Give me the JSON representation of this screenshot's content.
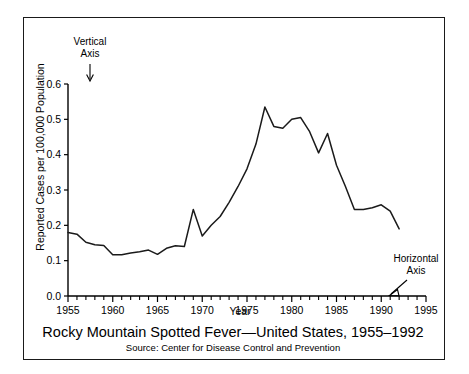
{
  "figure": {
    "title": "Rocky Mountain Spotted Fever—United States, 1955–1992",
    "source": "Source: Center for Disease Control and Prevention",
    "line_color": "#1a1a1a",
    "frame_color": "#1a1a1a",
    "background": "#ffffff"
  },
  "annotations": {
    "vertical_axis": {
      "line1": "Vertical",
      "line2": "Axis"
    },
    "horizontal_axis": {
      "line1": "Horizontal",
      "line2": "Axis"
    }
  },
  "chart_data": {
    "type": "line",
    "title": "Rocky Mountain Spotted Fever—United States, 1955–1992",
    "xlabel": "Year",
    "ylabel": "Reported Cases per 100,000 Population",
    "xlim": [
      1955,
      1995
    ],
    "ylim": [
      0.0,
      0.6
    ],
    "grid": false,
    "legend": "none",
    "x_tick_labels": [
      "1955",
      "1960",
      "1965",
      "1970",
      "1975",
      "1980",
      "1985",
      "1990",
      "1995"
    ],
    "x_tick_values": [
      1955,
      1960,
      1965,
      1970,
      1975,
      1980,
      1985,
      1990,
      1995
    ],
    "x_minor_step": 1,
    "y_tick_labels": [
      "0.0",
      "0.1",
      "0.2",
      "0.3",
      "0.4",
      "0.5",
      "0.6"
    ],
    "y_tick_values": [
      0.0,
      0.1,
      0.2,
      0.3,
      0.4,
      0.5,
      0.6
    ],
    "x": [
      1955,
      1956,
      1957,
      1958,
      1959,
      1960,
      1961,
      1962,
      1963,
      1964,
      1965,
      1966,
      1967,
      1968,
      1969,
      1970,
      1971,
      1972,
      1973,
      1974,
      1975,
      1976,
      1977,
      1978,
      1979,
      1980,
      1981,
      1982,
      1983,
      1984,
      1985,
      1986,
      1987,
      1988,
      1989,
      1990,
      1991,
      1992
    ],
    "values": [
      0.18,
      0.175,
      0.152,
      0.145,
      0.143,
      0.117,
      0.117,
      0.122,
      0.125,
      0.13,
      0.118,
      0.135,
      0.142,
      0.14,
      0.245,
      0.17,
      0.2,
      0.225,
      0.265,
      0.31,
      0.36,
      0.43,
      0.535,
      0.48,
      0.475,
      0.5,
      0.505,
      0.465,
      0.405,
      0.46,
      0.37,
      0.31,
      0.245,
      0.245,
      0.25,
      0.258,
      0.24,
      0.19
    ],
    "series": [
      {
        "name": "Reported cases per 100,000 population",
        "values": [
          0.18,
          0.175,
          0.152,
          0.145,
          0.143,
          0.117,
          0.117,
          0.122,
          0.125,
          0.13,
          0.118,
          0.135,
          0.142,
          0.14,
          0.245,
          0.17,
          0.2,
          0.225,
          0.265,
          0.31,
          0.36,
          0.43,
          0.535,
          0.48,
          0.475,
          0.5,
          0.505,
          0.465,
          0.405,
          0.46,
          0.37,
          0.31,
          0.245,
          0.245,
          0.25,
          0.258,
          0.24,
          0.19
        ]
      }
    ]
  }
}
